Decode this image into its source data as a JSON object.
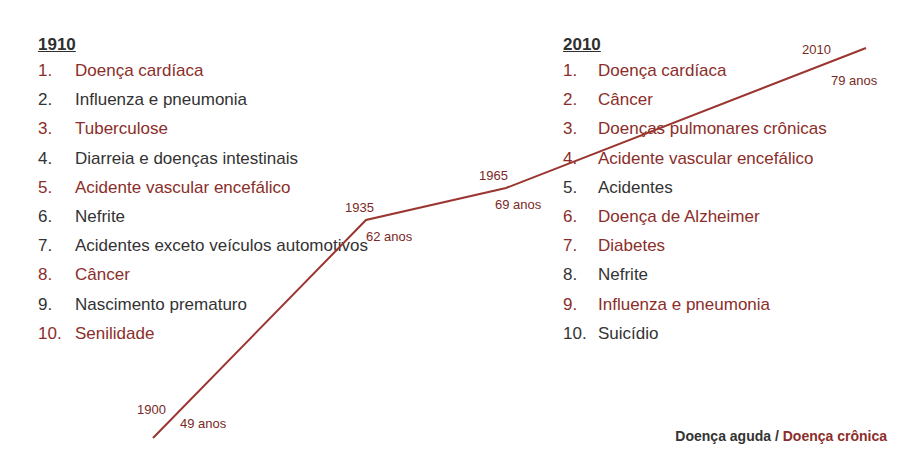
{
  "left": {
    "heading": "1910",
    "items": [
      {
        "num": "1.",
        "label": "Doença cardíaca",
        "type": "chronic"
      },
      {
        "num": "2.",
        "label": "Influenza e pneumonia",
        "type": "acute"
      },
      {
        "num": "3.",
        "label": "Tuberculose",
        "type": "chronic"
      },
      {
        "num": "4.",
        "label": "Diarreia e doenças intestinais",
        "type": "acute"
      },
      {
        "num": "5.",
        "label": "Acidente vascular encefálico",
        "type": "chronic"
      },
      {
        "num": "6.",
        "label": "Nefrite",
        "type": "acute"
      },
      {
        "num": "7.",
        "label": "Acidentes exceto veículos automotivos",
        "type": "acute"
      },
      {
        "num": "8.",
        "label": "Câncer",
        "type": "chronic"
      },
      {
        "num": "9.",
        "label": "Nascimento prematuro",
        "type": "acute"
      },
      {
        "num": "10.",
        "label": "Senilidade",
        "type": "chronic"
      }
    ]
  },
  "right": {
    "heading": "2010",
    "items": [
      {
        "num": "1.",
        "label": "Doença cardíaca",
        "type": "chronic"
      },
      {
        "num": "2.",
        "label": "Câncer",
        "type": "chronic"
      },
      {
        "num": "3.",
        "label": "Doenças pulmonares crônicas",
        "type": "chronic"
      },
      {
        "num": "4.",
        "label": "Acidente vascular encefálico",
        "type": "chronic"
      },
      {
        "num": "5.",
        "label": "Acidentes",
        "type": "acute"
      },
      {
        "num": "6.",
        "label": "Doença de Alzheimer",
        "type": "chronic"
      },
      {
        "num": "7.",
        "label": "Diabetes",
        "type": "chronic"
      },
      {
        "num": "8.",
        "label": "Nefrite",
        "type": "acute"
      },
      {
        "num": "9.",
        "label": "Influenza e pneumonia",
        "type": "chronic"
      },
      {
        "num": "10.",
        "label": "Suicídio",
        "type": "acute"
      }
    ]
  },
  "life_expectancy": {
    "points": [
      {
        "year": "1900",
        "age": "49 anos"
      },
      {
        "year": "1935",
        "age": "62 anos"
      },
      {
        "year": "1965",
        "age": "69 anos"
      },
      {
        "year": "2010",
        "age": "79 anos"
      }
    ]
  },
  "legend": {
    "acute": "Doença aguda",
    "separator": " / ",
    "chronic": "Doença crônica"
  },
  "colors": {
    "acute": "#333333",
    "chronic": "#8b2e2a",
    "line": "#9a3530"
  }
}
